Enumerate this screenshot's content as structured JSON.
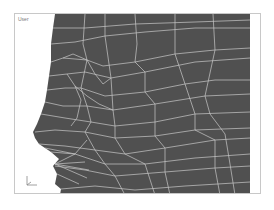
{
  "viewport": {
    "label": "User",
    "mesh_color": "#505050",
    "wire_color": "#c8c8c8",
    "background": "#ffffff"
  },
  "axis_gizmo": {
    "icon": "axis-tripod-icon"
  }
}
